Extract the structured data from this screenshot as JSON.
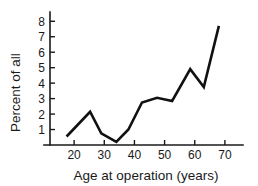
{
  "chart_data": {
    "type": "line",
    "title": "",
    "subtitle": "",
    "xlabel": "Age at operation (years)",
    "ylabel": "Percent of all",
    "xlim": [
      12,
      76
    ],
    "ylim": [
      0,
      8.6
    ],
    "xticks": [
      20,
      30,
      40,
      50,
      60,
      70
    ],
    "yticks": [
      1,
      2,
      3,
      4,
      5,
      6,
      7,
      8
    ],
    "xtick_labels": [
      "20",
      "30",
      "40",
      "50",
      "60",
      "70"
    ],
    "ytick_labels": [
      "1",
      "2",
      "3",
      "4",
      "5",
      "6",
      "7",
      "8"
    ],
    "grid": false,
    "legend": null,
    "annotations": [],
    "series": [
      {
        "name": "Percent of all",
        "color": "#111111",
        "x": [
          17.5,
          25.3,
          29.0,
          34.0,
          38.0,
          42.5,
          47.5,
          52.5,
          58.5,
          63.0,
          68.0
        ],
        "y": [
          0.55,
          2.15,
          0.75,
          0.2,
          1.0,
          2.75,
          3.05,
          2.85,
          4.9,
          3.75,
          7.7
        ]
      }
    ]
  },
  "axes": {
    "x_title": "Age at operation (years)",
    "y_title": "Percent of all"
  }
}
